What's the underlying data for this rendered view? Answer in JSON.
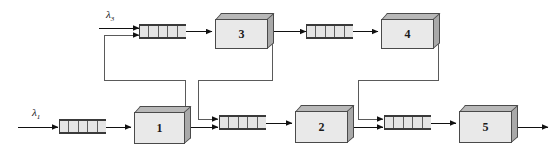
{
  "diagram": {
    "type": "queueing-network",
    "colors": {
      "server_face": "#e9e9e9",
      "server_top": "#b8b8b8",
      "server_side": "#a9a9a9",
      "outline": "#4a4a4a",
      "queue_fill": "#e4e4e4",
      "queue_border": "#3a3a3a",
      "wire": "#5a5a5a",
      "arrow": "#111111",
      "background": "#ffffff"
    },
    "arrivals": [
      {
        "id": "lambda-3",
        "symbol": "λ",
        "subscript": "3",
        "target": "queue-3"
      },
      {
        "id": "lambda-1",
        "symbol": "λ",
        "subscript": "1",
        "target": "queue-1"
      }
    ],
    "servers": [
      {
        "id": "server-3",
        "label": "3",
        "row": "top"
      },
      {
        "id": "server-4",
        "label": "4",
        "row": "top"
      },
      {
        "id": "server-1",
        "label": "1",
        "row": "bottom"
      },
      {
        "id": "server-2",
        "label": "2",
        "row": "bottom"
      },
      {
        "id": "server-5",
        "label": "5",
        "row": "bottom"
      }
    ],
    "queues": [
      {
        "id": "queue-3",
        "cells": 5,
        "feeds": "server-3",
        "inputs": 2
      },
      {
        "id": "queue-4",
        "cells": 5,
        "feeds": "server-4",
        "inputs": 1
      },
      {
        "id": "queue-1",
        "cells": 5,
        "feeds": "server-1",
        "inputs": 1
      },
      {
        "id": "queue-2",
        "cells": 5,
        "feeds": "server-2",
        "inputs": 2
      },
      {
        "id": "queue-5",
        "cells": 5,
        "feeds": "server-5",
        "inputs": 2
      }
    ],
    "links": [
      {
        "id": "link-lambda3-queue3",
        "from": "lambda-3",
        "to": "queue-3",
        "kind": "arrival"
      },
      {
        "id": "link-queue3-server3",
        "from": "queue-3",
        "to": "server-3",
        "kind": "service"
      },
      {
        "id": "link-server3-queue4",
        "from": "server-3",
        "to": "queue-4",
        "kind": "forward"
      },
      {
        "id": "link-queue4-server4",
        "from": "queue-4",
        "to": "server-4",
        "kind": "service"
      },
      {
        "id": "link-lambda1-queue1",
        "from": "lambda-1",
        "to": "queue-1",
        "kind": "arrival"
      },
      {
        "id": "link-queue1-server1",
        "from": "queue-1",
        "to": "server-1",
        "kind": "service"
      },
      {
        "id": "link-server1-queue2",
        "from": "server-1",
        "to": "queue-2",
        "kind": "forward"
      },
      {
        "id": "link-server1-queue3",
        "from": "server-1",
        "to": "queue-3",
        "kind": "feedback"
      },
      {
        "id": "link-server3-queue2",
        "from": "server-3",
        "to": "queue-2",
        "kind": "feedback"
      },
      {
        "id": "link-queue2-server2",
        "from": "queue-2",
        "to": "server-2",
        "kind": "service"
      },
      {
        "id": "link-server2-queue5",
        "from": "server-2",
        "to": "queue-5",
        "kind": "forward"
      },
      {
        "id": "link-server4-queue5",
        "from": "server-4",
        "to": "queue-5",
        "kind": "feedback"
      },
      {
        "id": "link-queue5-server5",
        "from": "queue-5",
        "to": "server-5",
        "kind": "service"
      },
      {
        "id": "link-server5-exit",
        "from": "server-5",
        "to": "departure",
        "kind": "departure"
      }
    ]
  }
}
